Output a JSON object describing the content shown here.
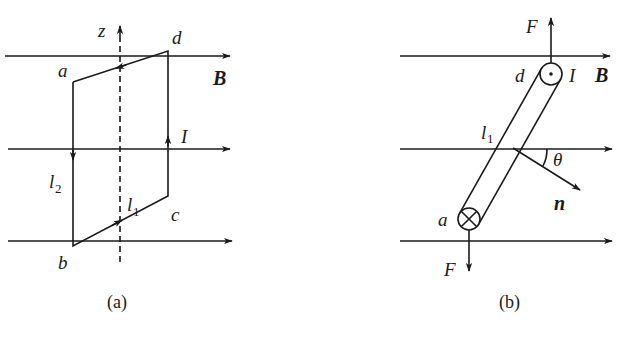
{
  "figure_a": {
    "caption": "(a)",
    "field_label": "B",
    "axis_label": "z",
    "current_label": "I",
    "vertices": {
      "a": "a",
      "b": "b",
      "c": "c",
      "d": "d"
    },
    "side_labels": {
      "l1": "l",
      "l1_sub": "1",
      "l2": "l",
      "l2_sub": "2"
    }
  },
  "figure_b": {
    "caption": "(b)",
    "field_label": "B",
    "current_label": "I",
    "force_top": "F",
    "force_bottom": "F",
    "normal_label": "n",
    "angle_label": "θ",
    "vertices": {
      "a": "a",
      "d": "d"
    },
    "side_labels": {
      "l1": "l",
      "l1_sub": "1"
    }
  },
  "colors": {
    "ink": "#1a1a1a",
    "background": "#ffffff"
  }
}
